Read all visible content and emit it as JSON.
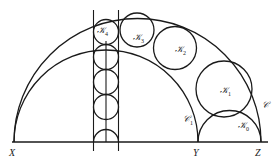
{
  "diagram": {
    "type": "Pappus chain in an arbelos",
    "points": [
      {
        "id": "X",
        "label": "X"
      },
      {
        "id": "Y",
        "label": "Y"
      },
      {
        "id": "Z",
        "label": "Z"
      }
    ],
    "semicircles": [
      {
        "id": "C",
        "label": "𝒞",
        "sub": "",
        "on": "XZ"
      },
      {
        "id": "C1",
        "label": "𝒞",
        "sub": "1",
        "on": "XY"
      },
      {
        "id": "K0",
        "label": "𝒦",
        "sub": "0",
        "on": "YZ"
      }
    ],
    "chain_circles": [
      {
        "id": "K1",
        "label": "𝒦",
        "sub": "1"
      },
      {
        "id": "K2",
        "label": "𝒦",
        "sub": "2"
      },
      {
        "id": "K3",
        "label": "𝒦",
        "sub": "3"
      },
      {
        "id": "K4",
        "label": "𝒦",
        "sub": "4"
      }
    ],
    "strip_circles_count": 5
  }
}
